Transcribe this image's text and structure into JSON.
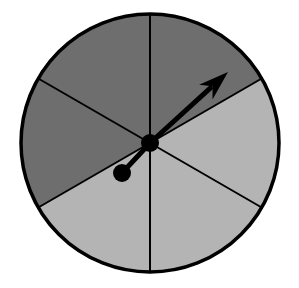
{
  "figure": {
    "name": "spinner-wheel",
    "type": "probability-spinner-diagram",
    "width": 299,
    "height": 288,
    "background_color": "#FFFFFF"
  },
  "chart_data": {
    "type": "pie",
    "title": "",
    "subtitle": "",
    "xlabel": "",
    "ylabel": "",
    "legend": [],
    "annotations": [],
    "grid": false,
    "categories": [
      "sector-upper-right",
      "sector-right",
      "sector-lower-right",
      "sector-lower-left",
      "sector-left",
      "sector-upper-left"
    ],
    "values": [
      60,
      60,
      60,
      60,
      60,
      60
    ],
    "units": "degrees",
    "slice_colors": [
      "#6E6E6E",
      "#B4B4B4",
      "#B4B4B4",
      "#B4B4B4",
      "#6E6E6E",
      "#6E6E6E"
    ],
    "slice_shades": [
      "dark",
      "light",
      "light",
      "light",
      "dark",
      "dark"
    ],
    "slice_start_angles_deg": [
      90,
      30,
      -30,
      -90,
      -150,
      150
    ],
    "slice_end_angles_deg": [
      30,
      -30,
      -90,
      -150,
      150,
      90
    ],
    "dark_count": 3,
    "light_count": 3,
    "total_sectors": 6
  },
  "geometry": {
    "center_x": 150,
    "center_y": 143,
    "radius": 129,
    "outline_color": "#000000",
    "outline_width": 3.5,
    "divider_color": "#000000",
    "divider_width": 2,
    "divider_angles_deg": [
      90,
      30,
      -30,
      -90,
      -150,
      150
    ]
  },
  "pointer": {
    "name": "spinner-arrow",
    "hub_x": 150,
    "hub_y": 143,
    "hub_radius": 9,
    "arrow_tip_x": 228,
    "arrow_tip_y": 72,
    "arrow_angle_deg": 42,
    "arrow_color": "#000000",
    "shaft_width": 5,
    "counterweight_x": 122,
    "counterweight_y": 173,
    "counterweight_radius": 9,
    "counterweight_color": "#000000"
  },
  "palette": {
    "dark_gray": "#6E6E6E",
    "light_gray": "#B4B4B4",
    "black": "#000000",
    "white": "#FFFFFF"
  }
}
